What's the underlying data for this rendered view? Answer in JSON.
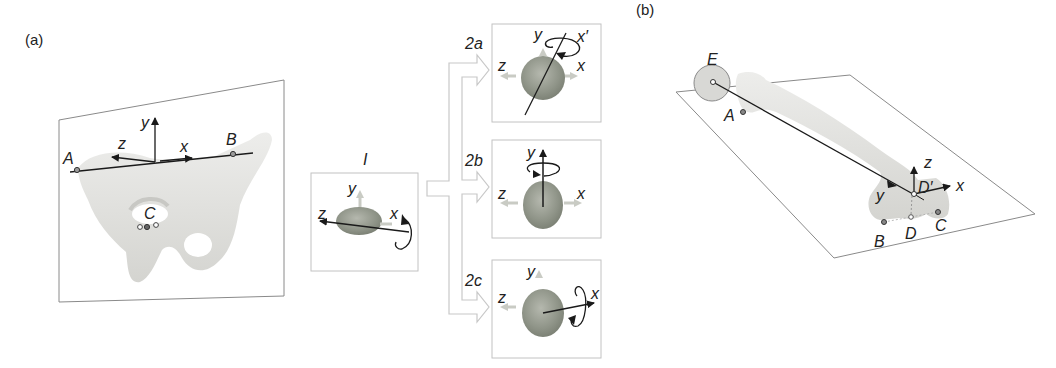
{
  "figure": {
    "panel_a": {
      "tag": "(a)",
      "pelvis": {
        "landmarks": [
          "A",
          "B",
          "C"
        ],
        "axes": [
          "x",
          "y",
          "z"
        ]
      },
      "step1": {
        "label": "I",
        "axes": [
          "x",
          "y",
          "z"
        ]
      },
      "step2": [
        {
          "label": "2a",
          "axes": [
            "x",
            "x′",
            "y",
            "z"
          ]
        },
        {
          "label": "2b",
          "axes": [
            "x",
            "y",
            "z"
          ]
        },
        {
          "label": "2c",
          "axes": [
            "x",
            "y",
            "z"
          ]
        }
      ]
    },
    "panel_b": {
      "tag": "(b)",
      "femur": {
        "landmarks": [
          "E",
          "A",
          "B",
          "C",
          "D",
          "D′"
        ],
        "axes": [
          "x",
          "y",
          "z"
        ]
      }
    }
  },
  "colors": {
    "bone": "#e6e6e3",
    "bone_shade": "#cfcfcb",
    "disc": "#8f9488",
    "frame": "#8a8a8a",
    "arrow_outline": "#c8c8c8",
    "axis": "#1a1a1a",
    "ghost_arrow": "#c9cbc4"
  }
}
